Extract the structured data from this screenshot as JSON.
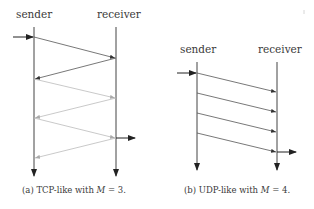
{
  "diagrams": [
    {
      "id": "tcp",
      "caption_prefix": "(a) TCP-like with ",
      "caption_var": "M",
      "caption_suffix": " = 3.",
      "sender_label": "sender",
      "receiver_label": "receiver",
      "M": 3
    },
    {
      "id": "udp",
      "caption_prefix": "(b) UDP-like with ",
      "caption_var": "M",
      "caption_suffix": " = 4.",
      "sender_label": "sender",
      "receiver_label": "receiver",
      "M": 4
    }
  ],
  "colors": {
    "line": "#444444",
    "faded_line": "#b8b8b8"
  }
}
